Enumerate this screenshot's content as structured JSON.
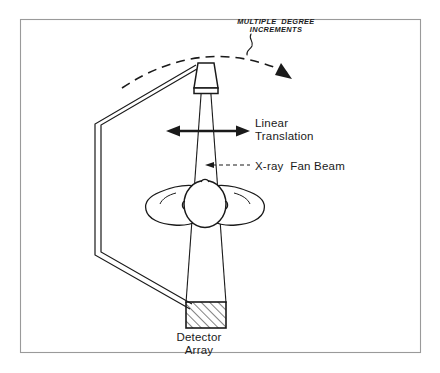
{
  "figure": {
    "background_color": "#ffffff",
    "ink_color": "#1a1a1a",
    "frame_color": "#9a9a9a"
  },
  "labels": {
    "rotation": {
      "line1": "MULTIPLE  DEGREE",
      "line2": "INCREMENTS"
    },
    "translation": {
      "line1": "Linear",
      "line2": "Translation"
    },
    "beam": "X-ray  Fan Beam",
    "detector": {
      "line1": "Detector",
      "line2": "Array"
    }
  },
  "components": [
    {
      "name": "x-ray-tube",
      "label": "X-ray tube",
      "shape": "trapezoid"
    },
    {
      "name": "gantry-arm",
      "label": "Gantry C-arm",
      "shape": "double-line-bracket"
    },
    {
      "name": "fan-beam",
      "label": "X-ray fan beam",
      "shape": "wedge"
    },
    {
      "name": "patient-head",
      "label": "Patient head, axial view",
      "shape": "oval-with-shoulders"
    },
    {
      "name": "detector-array",
      "label": "Detector array",
      "shape": "hatched-rectangle"
    },
    {
      "name": "rotation-arc",
      "label": "Rotation increment arc",
      "shape": "dashed-arc-with-arrow"
    },
    {
      "name": "translation-arrow",
      "label": "Linear translation arrow",
      "shape": "double-headed-arrow"
    }
  ]
}
